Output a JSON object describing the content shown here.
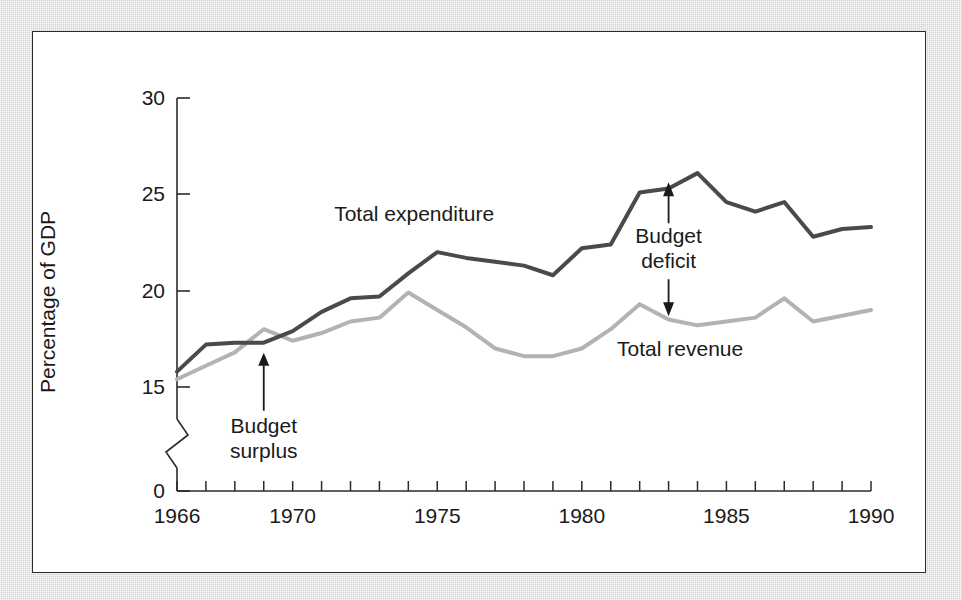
{
  "figure": {
    "background_color": "#ffffff",
    "mat_color": "#d9d9d9",
    "border_color": "#2b2b2b"
  },
  "chart_data": {
    "type": "line",
    "title": "",
    "xlabel": "",
    "ylabel": "Percentage of GDP",
    "xlim": [
      1966,
      1990
    ],
    "ylim": [
      15,
      30
    ],
    "y_axis_break": true,
    "y_axis_break_to": 0,
    "grid": false,
    "legend_position": "inline-annotations",
    "ytick_labels": [
      "30",
      "25",
      "20",
      "15",
      "0"
    ],
    "ytick_values": [
      30,
      25,
      20,
      15,
      0
    ],
    "xtick_labels": [
      "1966",
      "1970",
      "1975",
      "1980",
      "1985",
      "1990"
    ],
    "xtick_values": [
      1966,
      1970,
      1975,
      1980,
      1985,
      1990
    ],
    "x_minor_ticks_every": 1,
    "x": [
      1966,
      1967,
      1968,
      1969,
      1970,
      1971,
      1972,
      1973,
      1974,
      1975,
      1976,
      1977,
      1978,
      1979,
      1980,
      1981,
      1982,
      1983,
      1984,
      1985,
      1986,
      1987,
      1988,
      1989,
      1990
    ],
    "series": [
      {
        "name": "Total expenditure",
        "color": "#4a4a4a",
        "width": 4,
        "values": [
          15.8,
          17.2,
          17.3,
          17.3,
          17.9,
          18.9,
          19.6,
          19.7,
          20.9,
          22.0,
          21.7,
          21.5,
          21.3,
          20.8,
          22.2,
          22.4,
          25.1,
          25.3,
          26.1,
          24.6,
          24.1,
          24.6,
          22.8,
          23.2,
          23.3
        ]
      },
      {
        "name": "Total revenue",
        "color": "#b3b3b3",
        "width": 4,
        "values": [
          15.4,
          16.1,
          16.8,
          18.0,
          17.4,
          17.8,
          18.4,
          18.6,
          19.9,
          19.0,
          18.1,
          17.0,
          16.6,
          16.6,
          17.0,
          18.0,
          19.3,
          18.5,
          18.2,
          18.4,
          18.6,
          19.6,
          18.4,
          18.7,
          19.0
        ]
      }
    ],
    "annotations": [
      {
        "id": "budget-surplus",
        "text_line_1": "Budget",
        "text_line_2": "surplus",
        "points_to_year": 1969,
        "points_to_value": 17.3,
        "arrow": "single-up"
      },
      {
        "id": "budget-deficit",
        "text_line_1": "Budget",
        "text_line_2": "deficit",
        "points_to_year": 1983,
        "top_value": 26.1,
        "bottom_value": 18.2,
        "arrow": "double-vertical"
      }
    ],
    "series_inline_labels": [
      {
        "id": "total-expenditure-label",
        "text": "Total expenditure",
        "year": 1974.2,
        "value": 23.6
      },
      {
        "id": "total-revenue-label",
        "text": "Total revenue",
        "year": 1983.4,
        "value": 16.6
      }
    ]
  }
}
